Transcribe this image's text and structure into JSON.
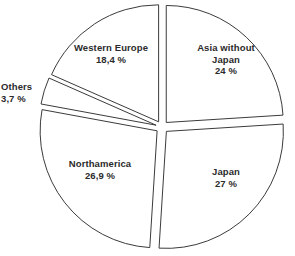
{
  "chart_data": {
    "type": "pie",
    "title": "",
    "subtitle": "",
    "xlabel": "",
    "ylabel": "",
    "legend_position": "none",
    "grid": false,
    "value_suffix": "%",
    "decimal_separator": ",",
    "total": 100,
    "categories": [
      "Asia without Japan",
      "Japan",
      "Northamerica",
      "Others",
      "Western Europe"
    ],
    "values": [
      24,
      27,
      26.9,
      3.7,
      18.4
    ],
    "value_labels": [
      "24 %",
      "27 %",
      "26,9 %",
      "3,7 %",
      "18,4 %"
    ],
    "slices": [
      {
        "name": "asia-without-japan",
        "label_lines": [
          "Asia without",
          "Japan"
        ],
        "label_text": "Asia without Japan",
        "value": 24,
        "value_label": "24 %",
        "start_angle": 0,
        "end_angle": 86.4,
        "exploded": true,
        "fill": "#ffffff",
        "stroke": "#3b3b3b"
      },
      {
        "name": "japan",
        "label_lines": [
          "Japan"
        ],
        "label_text": "Japan",
        "value": 27,
        "value_label": "27 %",
        "start_angle": 86.4,
        "end_angle": 183.6,
        "exploded": true,
        "fill": "#ffffff",
        "stroke": "#3b3b3b"
      },
      {
        "name": "northamerica",
        "label_lines": [
          "Northamerica"
        ],
        "label_text": "Northamerica",
        "value": 26.9,
        "value_label": "26,9 %",
        "start_angle": 183.6,
        "end_angle": 280.44,
        "exploded": true,
        "fill": "#ffffff",
        "stroke": "#3b3b3b"
      },
      {
        "name": "others",
        "label_lines": [
          "Others"
        ],
        "label_text": "Others",
        "value": 3.7,
        "value_label": "3,7 %",
        "start_angle": 280.44,
        "end_angle": 293.76,
        "exploded": true,
        "fill": "#ffffff",
        "stroke": "#3b3b3b"
      },
      {
        "name": "western-europe",
        "label_lines": [
          "Western Europe"
        ],
        "label_text": "Western Europe",
        "value": 18.4,
        "value_label": "18,4 %",
        "start_angle": 293.76,
        "end_angle": 360,
        "exploded": true,
        "fill": "#ffffff",
        "stroke": "#3b3b3b"
      }
    ]
  },
  "labels": {
    "asia": {
      "line1": "Asia without",
      "line2": "Japan",
      "value": "24 %"
    },
    "japan": {
      "line1": "Japan",
      "value": "27 %"
    },
    "northamerica": {
      "line1": "Northamerica",
      "value": "26,9 %"
    },
    "others": {
      "line1": "Others",
      "value": "3,7 %"
    },
    "western_europe": {
      "line1": "Western Europe",
      "value": "18,4 %"
    }
  },
  "style": {
    "background": "#ffffff",
    "stroke_color": "#3b3b3b",
    "text_color": "#2b2b2b"
  }
}
